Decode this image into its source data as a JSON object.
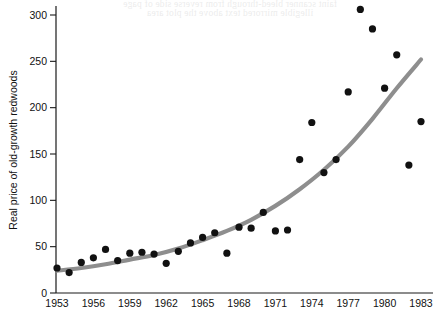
{
  "figure": {
    "ghost_text_lines": [
      "faint scanner bleed-through from reverse side of page",
      "illegible mirrored text above the plot area"
    ]
  },
  "chart_data": {
    "type": "scatter",
    "title": "",
    "subtitle": "",
    "xlabel": "",
    "ylabel": "Real price of old-growth redwoods",
    "xlim": [
      1953,
      1984
    ],
    "ylim": [
      0,
      315
    ],
    "grid": false,
    "legend": null,
    "x_tick_labels": [
      "1953",
      "1956",
      "1959",
      "1962",
      "1965",
      "1968",
      "1971",
      "1974",
      "1977",
      "1980",
      "1983"
    ],
    "x_ticks": [
      1953,
      1956,
      1959,
      1962,
      1965,
      1968,
      1971,
      1974,
      1977,
      1980,
      1983
    ],
    "y_tick_labels": [
      "0",
      "50",
      "100",
      "150",
      "200",
      "250",
      "300"
    ],
    "y_ticks": [
      0,
      50,
      100,
      150,
      200,
      250,
      300
    ],
    "marker": "filled-circle",
    "marker_color": "#111111",
    "x": [
      1953,
      1954,
      1955,
      1956,
      1957,
      1958,
      1959,
      1960,
      1961,
      1962,
      1963,
      1964,
      1965,
      1966,
      1967,
      1968,
      1969,
      1970,
      1971,
      1972,
      1973,
      1974,
      1975,
      1976,
      1977,
      1978,
      1979,
      1980,
      1981,
      1982,
      1983
    ],
    "values": [
      27,
      22,
      33,
      38,
      47,
      35,
      43,
      44,
      42,
      32,
      45,
      54,
      60,
      65,
      43,
      71,
      70,
      87,
      67,
      68,
      144,
      184,
      130,
      144,
      217,
      306,
      285,
      221,
      257,
      138,
      185
    ],
    "series": [
      {
        "name": "Real price of old-growth redwoods",
        "type": "scatter",
        "color": "#111111",
        "points": [
          {
            "x": 1953,
            "y": 27
          },
          {
            "x": 1954,
            "y": 22
          },
          {
            "x": 1955,
            "y": 33
          },
          {
            "x": 1956,
            "y": 38
          },
          {
            "x": 1957,
            "y": 47
          },
          {
            "x": 1958,
            "y": 35
          },
          {
            "x": 1959,
            "y": 43
          },
          {
            "x": 1960,
            "y": 44
          },
          {
            "x": 1961,
            "y": 42
          },
          {
            "x": 1962,
            "y": 32
          },
          {
            "x": 1963,
            "y": 45
          },
          {
            "x": 1964,
            "y": 54
          },
          {
            "x": 1965,
            "y": 60
          },
          {
            "x": 1966,
            "y": 65
          },
          {
            "x": 1967,
            "y": 43
          },
          {
            "x": 1968,
            "y": 71
          },
          {
            "x": 1969,
            "y": 70
          },
          {
            "x": 1970,
            "y": 87
          },
          {
            "x": 1971,
            "y": 67
          },
          {
            "x": 1972,
            "y": 68
          },
          {
            "x": 1973,
            "y": 144
          },
          {
            "x": 1974,
            "y": 184
          },
          {
            "x": 1975,
            "y": 130
          },
          {
            "x": 1976,
            "y": 144
          },
          {
            "x": 1977,
            "y": 217
          },
          {
            "x": 1978,
            "y": 306
          },
          {
            "x": 1979,
            "y": 285
          },
          {
            "x": 1980,
            "y": 221
          },
          {
            "x": 1981,
            "y": 257
          },
          {
            "x": 1982,
            "y": 138
          },
          {
            "x": 1983,
            "y": 185
          }
        ]
      },
      {
        "name": "fitted exponential trend",
        "type": "line",
        "color": "#8e8e8e",
        "points": [
          {
            "x": 1953,
            "y": 24
          },
          {
            "x": 1955,
            "y": 27
          },
          {
            "x": 1957,
            "y": 31
          },
          {
            "x": 1959,
            "y": 36
          },
          {
            "x": 1961,
            "y": 41
          },
          {
            "x": 1963,
            "y": 48
          },
          {
            "x": 1965,
            "y": 57
          },
          {
            "x": 1967,
            "y": 67
          },
          {
            "x": 1969,
            "y": 79
          },
          {
            "x": 1971,
            "y": 94
          },
          {
            "x": 1973,
            "y": 112
          },
          {
            "x": 1975,
            "y": 133
          },
          {
            "x": 1977,
            "y": 158
          },
          {
            "x": 1979,
            "y": 188
          },
          {
            "x": 1981,
            "y": 221
          },
          {
            "x": 1983,
            "y": 252
          }
        ]
      }
    ]
  }
}
